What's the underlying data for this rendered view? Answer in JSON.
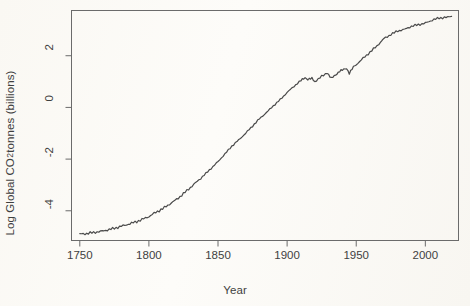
{
  "chart_data": {
    "type": "line",
    "title": "",
    "xlabel": "Year",
    "ylabel": "Log Global CO2 tonnes (billions)",
    "ylabel_parts": {
      "pre": "Log Global CO",
      "sub": "2",
      "post": " tonnes (billions)"
    },
    "xlim": [
      1744,
      2024
    ],
    "ylim": [
      -5.15,
      3.75
    ],
    "xticks": [
      1750,
      1800,
      1850,
      1900,
      1950,
      2000
    ],
    "xticklabels": [
      "1750",
      "1800",
      "1850",
      "1900",
      "1950",
      "2000"
    ],
    "yticks": [
      2,
      0,
      -2,
      -4
    ],
    "yticklabels": [
      "2",
      "0",
      "-2",
      "-4"
    ],
    "grid": false,
    "legend": null,
    "line_color": "#4a4a4a",
    "background_color": "#fbfaf7",
    "series": [
      {
        "name": "Log Global CO2 emissions",
        "x": [
          1750,
          1755,
          1760,
          1765,
          1770,
          1775,
          1780,
          1785,
          1790,
          1795,
          1800,
          1805,
          1810,
          1815,
          1820,
          1825,
          1830,
          1835,
          1840,
          1845,
          1850,
          1855,
          1860,
          1865,
          1870,
          1875,
          1880,
          1885,
          1890,
          1895,
          1900,
          1905,
          1910,
          1913,
          1915,
          1918,
          1920,
          1925,
          1929,
          1932,
          1935,
          1938,
          1940,
          1943,
          1945,
          1948,
          1950,
          1955,
          1960,
          1965,
          1970,
          1975,
          1980,
          1985,
          1990,
          1995,
          2000,
          2005,
          2010,
          2015,
          2019
        ],
        "y": [
          -4.9,
          -4.88,
          -4.84,
          -4.8,
          -4.74,
          -4.68,
          -4.6,
          -4.52,
          -4.44,
          -4.34,
          -4.22,
          -4.06,
          -3.92,
          -3.74,
          -3.56,
          -3.34,
          -3.1,
          -2.86,
          -2.62,
          -2.36,
          -2.1,
          -1.8,
          -1.5,
          -1.26,
          -1.0,
          -0.72,
          -0.44,
          -0.2,
          0.06,
          0.3,
          0.58,
          0.82,
          1.04,
          1.16,
          1.08,
          1.12,
          1.0,
          1.2,
          1.34,
          1.12,
          1.26,
          1.4,
          1.44,
          1.52,
          1.32,
          1.56,
          1.66,
          1.9,
          2.14,
          2.38,
          2.66,
          2.82,
          2.96,
          3.02,
          3.14,
          3.2,
          3.26,
          3.38,
          3.46,
          3.48,
          3.52
        ],
        "y_unit": "log billions of tonnes CO2"
      }
    ]
  }
}
